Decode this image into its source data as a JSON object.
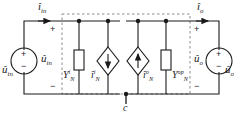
{
  "figure": {
    "type": "circuit-schematic",
    "colors": {
      "wire": "#1a1a1a",
      "dashed": "#7d7d7d",
      "background": "#ffffff",
      "text": "#1a1a1a"
    }
  },
  "labels": {
    "current_in": {
      "base": "i",
      "sub": "in",
      "hat": true
    },
    "current_out": {
      "base": "i",
      "sub": "o",
      "hat": true
    },
    "source_left_inner": {
      "base": "u",
      "sub": "in",
      "hat": true
    },
    "source_left_outer": {
      "base": "u",
      "sub": "in",
      "hat": true
    },
    "source_right_inner": {
      "base": "u",
      "sub": "o",
      "hat": true
    },
    "source_right_outer": {
      "base": "u",
      "sub": "o",
      "hat": true
    },
    "admittance_left": {
      "base": "Y",
      "sub": "N",
      "sup": "i",
      "hat": false
    },
    "admittance_right": {
      "base": "Y",
      "sub": "N",
      "sup": "op",
      "hat": false
    },
    "dep_source_left": {
      "base": "i",
      "sub": "N",
      "sup": "i",
      "hat": true
    },
    "dep_source_right": {
      "base": "i",
      "sub": "N",
      "sup": "o",
      "hat": true
    },
    "common_node": {
      "base": "c",
      "hat": false
    }
  },
  "signs": {
    "src_left_plus": "+",
    "src_left_minus": "−",
    "src_right_plus": "+",
    "src_right_minus": "−",
    "port_left_plus": "+",
    "port_left_minus": "−",
    "port_right_plus": "+",
    "port_right_minus": "−"
  },
  "elements": {
    "voltage_source_left": "circle-source",
    "voltage_source_right": "circle-source",
    "admittance_left": "rectangle-impedance",
    "admittance_right": "rectangle-impedance",
    "dependent_source_left": "diamond-current-source",
    "dependent_source_right": "diamond-current-source",
    "boundary": "dashed-rectangle",
    "ground_node": "filled-dot"
  }
}
